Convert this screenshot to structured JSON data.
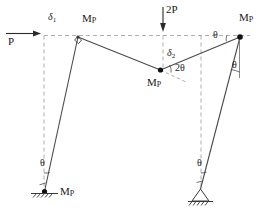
{
  "figure": {
    "type": "structural-collapse-mechanism-diagram",
    "stroke_color": "#444444",
    "dashed_color": "#999999",
    "text_color": "#1a1a1a",
    "background": "#ffffff"
  },
  "loads": [
    {
      "id": "horizontal-load",
      "label": "P",
      "direction": "right",
      "applied_at": "top-left-joint-level"
    },
    {
      "id": "vertical-load",
      "label": "2P",
      "direction": "down",
      "applied_at": "beam-midspan"
    }
  ],
  "displacements": [
    {
      "id": "sway-displacement",
      "symbol": "δ",
      "subscript": "1"
    },
    {
      "id": "vertical-displacement",
      "symbol": "δ",
      "subscript": "2"
    }
  ],
  "plastic_hinges": [
    {
      "id": "hinge-left-base",
      "label": "M",
      "subscript": "P",
      "location": "left-column-base"
    },
    {
      "id": "hinge-left-joint",
      "label": "M",
      "subscript": "P",
      "location": "top-left-joint"
    },
    {
      "id": "hinge-midspan",
      "label": "M",
      "subscript": "P",
      "location": "beam-midspan"
    },
    {
      "id": "hinge-right-joint",
      "label": "M",
      "subscript": "P",
      "location": "top-right-joint"
    }
  ],
  "rotations": [
    {
      "id": "rotation-left-column",
      "label": "θ",
      "location": "left-column-lower"
    },
    {
      "id": "rotation-right-column-lower",
      "label": "θ",
      "location": "right-column-lower"
    },
    {
      "id": "rotation-right-column-upper",
      "label": "θ",
      "location": "right-column-upper"
    },
    {
      "id": "rotation-beam-right",
      "label": "θ",
      "location": "beam-right-end"
    },
    {
      "id": "rotation-midspan",
      "label": "2θ",
      "location": "beam-midspan-hinge"
    }
  ],
  "supports": [
    {
      "id": "support-left",
      "type": "fixed-hatched",
      "position": "left-column-base"
    },
    {
      "id": "support-right",
      "type": "pinned-triangle",
      "position": "right-column-base"
    }
  ],
  "markers": [
    {
      "id": "right-angle-marker",
      "type": "right-angle-square",
      "location": "top-left-joint"
    }
  ]
}
